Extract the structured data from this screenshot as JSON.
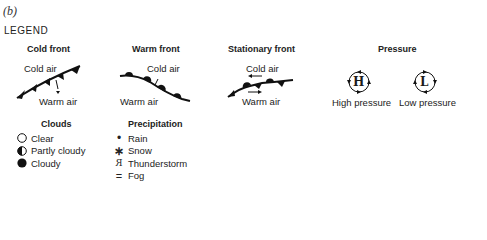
{
  "panel_label": "(b)",
  "legend_title": "LEGEND",
  "fronts": {
    "cold": {
      "title": "Cold front",
      "top_label": "Cold air",
      "bottom_label": "Warm air"
    },
    "warm": {
      "title": "Warm front",
      "top_label": "Cold air",
      "bottom_label": "Warm air"
    },
    "stationary": {
      "title": "Stationary front",
      "top_label": "Cold air",
      "bottom_label": "Warm air"
    }
  },
  "pressure": {
    "title": "Pressure",
    "high": {
      "symbol": "H",
      "label": "High pressure"
    },
    "low": {
      "symbol": "L",
      "label": "Low pressure"
    }
  },
  "clouds": {
    "title": "Clouds",
    "items": [
      {
        "icon": "empty-circle-icon",
        "label": "Clear"
      },
      {
        "icon": "half-filled-circle-icon",
        "label": "Partly cloudy"
      },
      {
        "icon": "filled-circle-icon",
        "label": "Cloudy"
      }
    ]
  },
  "precipitation": {
    "title": "Precipitation",
    "items": [
      {
        "icon": "dot-icon",
        "glyph": "•",
        "label": "Rain"
      },
      {
        "icon": "asterisk-icon",
        "glyph": "∗",
        "label": "Snow"
      },
      {
        "icon": "thunderstorm-icon",
        "glyph": "R",
        "label": "Thunderstorm"
      },
      {
        "icon": "fog-icon",
        "glyph": "=",
        "label": "Fog"
      }
    ]
  }
}
